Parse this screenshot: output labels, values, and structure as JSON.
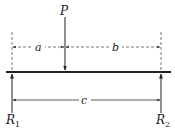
{
  "diagram": {
    "type": "simply-supported-beam",
    "load": {
      "label": "P"
    },
    "dimensions": [
      {
        "name": "a",
        "label": "a"
      },
      {
        "name": "b",
        "label": "b"
      },
      {
        "name": "c",
        "label": "c"
      }
    ],
    "reactions": [
      {
        "label": "R",
        "subscript": "1"
      },
      {
        "label": "R",
        "subscript": "2"
      }
    ],
    "colors": {
      "line": "#222222",
      "dashed": "#555555"
    }
  }
}
